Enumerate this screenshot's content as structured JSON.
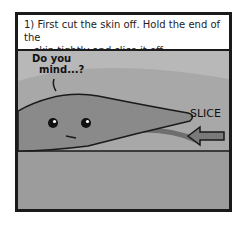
{
  "caption": {
    "line1": "1) First cut the skin off. Hold the end of the",
    "line2": "skin tightly and slice it off."
  },
  "speech": {
    "line1": "Do you",
    "line2": "mind...?"
  },
  "action_label": "SLICE",
  "colors": {
    "border": "#1a1a1a",
    "background": "#a8a8a8",
    "fish": "#8a8a8a",
    "board": "#9c9c9c",
    "arrow": "#7a7a7a"
  }
}
